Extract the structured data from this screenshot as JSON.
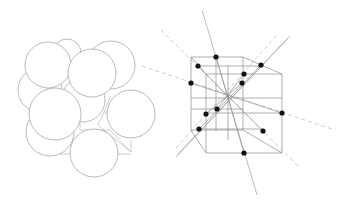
{
  "figure": {
    "colors": {
      "background": "#ffffff",
      "line": "#9a9a9a",
      "sphere_stroke": "#a8a8a8",
      "dot": "#111111",
      "dashed_axis": "#b0b0b0"
    },
    "sphere_model": {
      "label": "",
      "spheres": [
        {
          "cx": 67,
          "cy": 53,
          "r": 14
        },
        {
          "cx": 40,
          "cy": 90,
          "r": 22
        },
        {
          "cx": 48,
          "cy": 65,
          "r": 23
        },
        {
          "cx": 111,
          "cy": 65,
          "r": 24
        },
        {
          "cx": 83,
          "cy": 100,
          "r": 22
        },
        {
          "cx": 50,
          "cy": 132,
          "r": 24
        },
        {
          "cx": 92,
          "cy": 73,
          "r": 24
        },
        {
          "cx": 55,
          "cy": 114,
          "r": 26
        },
        {
          "cx": 131,
          "cy": 114,
          "r": 24
        },
        {
          "cx": 94,
          "cy": 153,
          "r": 24
        }
      ]
    },
    "lattice_cube": {
      "atom_sites": [
        {
          "x": 216,
          "y": 57
        },
        {
          "x": 198,
          "y": 66
        },
        {
          "x": 261,
          "y": 65
        },
        {
          "x": 244,
          "y": 74
        },
        {
          "x": 191,
          "y": 83
        },
        {
          "x": 242,
          "y": 83
        },
        {
          "x": 217,
          "y": 109
        },
        {
          "x": 206,
          "y": 114
        },
        {
          "x": 282,
          "y": 113
        },
        {
          "x": 199,
          "y": 129
        },
        {
          "x": 263,
          "y": 131
        },
        {
          "x": 244,
          "y": 153
        }
      ],
      "center": {
        "x": 228,
        "y": 97
      }
    }
  }
}
